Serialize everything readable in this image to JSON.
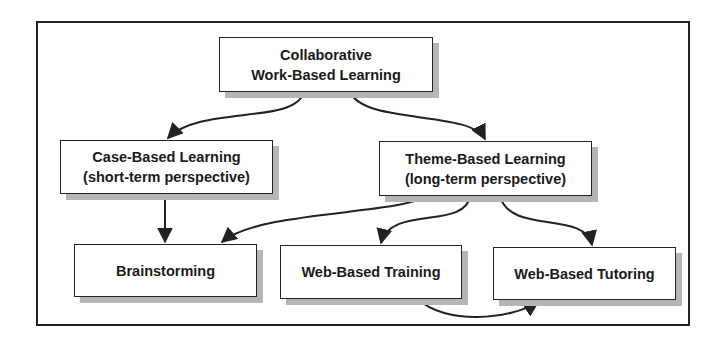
{
  "diagram": {
    "type": "hierarchy-flow",
    "nodes": [
      {
        "id": "cwbl",
        "lines": [
          "Collaborative",
          "Work-Based Learning"
        ]
      },
      {
        "id": "cbl",
        "lines": [
          "Case-Based Learning",
          "(short-term perspective)"
        ]
      },
      {
        "id": "tbl",
        "lines": [
          "Theme-Based Learning",
          "(long-term perspective)"
        ]
      },
      {
        "id": "brainstorming",
        "lines": [
          "Brainstorming"
        ]
      },
      {
        "id": "wbtraining",
        "lines": [
          "Web-Based Training"
        ]
      },
      {
        "id": "wbtutoring",
        "lines": [
          "Web-Based Tutoring"
        ]
      }
    ],
    "edges": [
      {
        "from": "cwbl",
        "to": "cbl"
      },
      {
        "from": "cwbl",
        "to": "tbl"
      },
      {
        "from": "cbl",
        "to": "brainstorming"
      },
      {
        "from": "tbl",
        "to": "brainstorming"
      },
      {
        "from": "tbl",
        "to": "wbtraining"
      },
      {
        "from": "tbl",
        "to": "wbtutoring"
      },
      {
        "from": "wbtraining",
        "to": "wbtutoring"
      }
    ]
  },
  "colors": {
    "line": "#222222",
    "shadow": "#b5b5b5",
    "text": "#1a1a1a",
    "background": "#ffffff"
  }
}
